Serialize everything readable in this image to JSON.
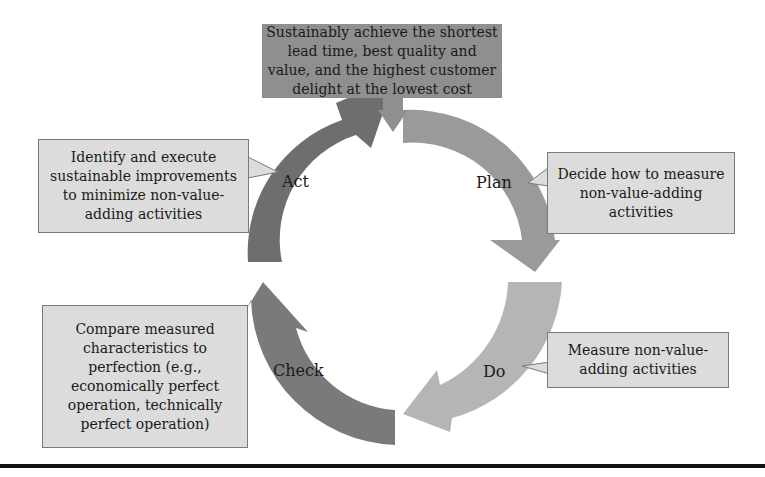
{
  "goal": {
    "text": "Sustainably achieve the shortest lead time, best quality and value, and the highest customer delight at the lowest cost"
  },
  "phases": {
    "plan": {
      "label": "Plan",
      "description": "Decide how to measure\nnon-value-adding\nactivities",
      "color": "#9a9a9a"
    },
    "do": {
      "label": "Do",
      "description": "Measure non-value-\nadding activities",
      "color": "#b5b5b5"
    },
    "check": {
      "label": "Check",
      "description": "Compare measured\ncharacteristics to\nperfection (e.g.,\neconomically perfect\noperation, technically\nperfect operation)",
      "color": "#7a7a7a"
    },
    "act": {
      "label": "Act",
      "description": "Identify and execute\nsustainable improvements\nto minimize non-value-\nadding activities",
      "color": "#6e6e6e"
    }
  },
  "colors": {
    "goal_box": "#8f8f8f",
    "callout_fill": "#dcdcdc",
    "callout_border": "#7a7a7a",
    "bottom_rule": "#111111"
  }
}
